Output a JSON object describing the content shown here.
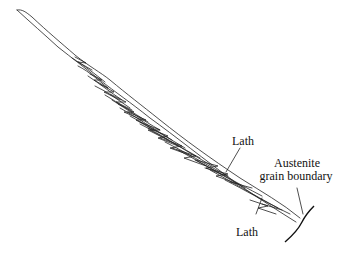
{
  "diagram": {
    "labels": {
      "lath_upper": "Lath",
      "austenite_line1": "Austenite",
      "austenite_line2": "grain boundary",
      "lath_lower": "Lath"
    },
    "stroke_color": "#222222",
    "background_color": "#ffffff"
  }
}
